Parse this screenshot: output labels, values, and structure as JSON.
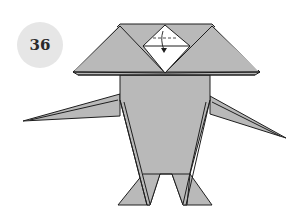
{
  "step": {
    "number": "36"
  },
  "diagram": {
    "fill_color": "#b9b9b9",
    "line_color": "#1e1e1e",
    "highlight_color": "#ffffff",
    "badge_color": "#e6e6e6",
    "annotations": [
      "fold-down-arrow",
      "dashed-valley-fold-line"
    ]
  }
}
